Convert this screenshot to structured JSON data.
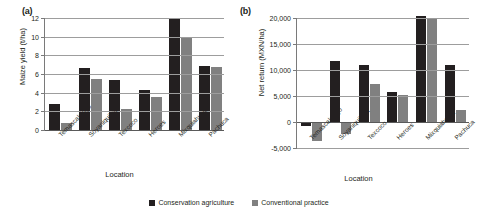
{
  "figure": {
    "panel_a_label": "(a)",
    "panel_b_label": "(b)"
  },
  "legend": {
    "items": [
      {
        "label": "Conservation agriculture",
        "color": "#231f20"
      },
      {
        "label": "Conventional practice",
        "color": "#808080"
      }
    ]
  },
  "chart_data": [
    {
      "type": "bar",
      "panel": "(a)",
      "title": "",
      "xlabel": "Location",
      "ylabel": "Maize yield (t/ha)",
      "categories": [
        "Temascalcingo",
        "Soyaniquilpan",
        "Texcoco",
        "Heroes",
        "Mixquiahuala",
        "Pachuca"
      ],
      "series": [
        {
          "name": "Conservation agriculture",
          "color": "#231f20",
          "values": [
            2.8,
            6.6,
            5.4,
            4.3,
            12.0,
            6.9
          ]
        },
        {
          "name": "Conventional practice",
          "color": "#808080",
          "values": [
            0.7,
            5.5,
            2.3,
            3.5,
            10.0,
            6.7
          ]
        }
      ],
      "ylim": [
        0,
        12
      ],
      "yticks": [
        0,
        2,
        4,
        6,
        8,
        10,
        12
      ],
      "ytick_labels": [
        "0",
        "2",
        "4",
        "6",
        "8",
        "10",
        "12"
      ],
      "grid": true,
      "legend_position": "bottom"
    },
    {
      "type": "bar",
      "panel": "(b)",
      "title": "",
      "xlabel": "Location",
      "ylabel": "Net return (MXN/ha)",
      "categories": [
        "Temascalcingo",
        "Soyaniquilpan",
        "Texcoco",
        "Heroes",
        "Mixquiahuala",
        "Pachuca"
      ],
      "series": [
        {
          "name": "Conservation agriculture",
          "color": "#231f20",
          "values": [
            -800,
            11700,
            11000,
            5700,
            20300,
            11000
          ]
        },
        {
          "name": "Conventional practice",
          "color": "#808080",
          "values": [
            -3600,
            -2300,
            7300,
            5200,
            19800,
            2400
          ]
        }
      ],
      "ylim": [
        -5000,
        20000
      ],
      "yticks": [
        -5000,
        0,
        5000,
        10000,
        15000,
        20000
      ],
      "ytick_labels": [
        "-5,000",
        "0",
        "5,000",
        "10,000",
        "15,000",
        "20,000"
      ],
      "grid": true,
      "legend_position": "bottom"
    }
  ]
}
